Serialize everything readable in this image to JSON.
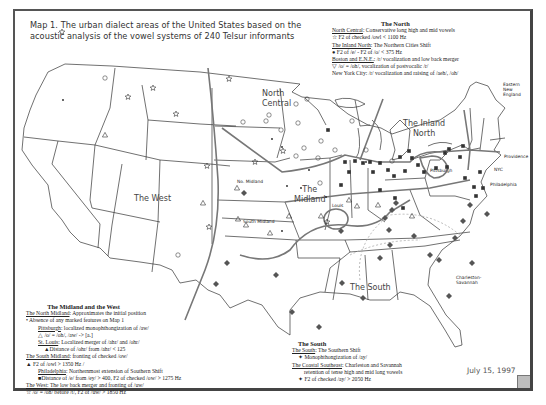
{
  "title": {
    "line1": "Map 1. The urban dialect areas of the United States based on the",
    "line2": "acoustic analysis of  the vowel systems of 240 Telsur informants"
  },
  "date": "July 15, 1997",
  "region_labels": {
    "north_central": [
      "North",
      "Central"
    ],
    "inland_north": [
      "The Inland",
      "North"
    ],
    "west": "The West",
    "midland": [
      "The",
      "Midland"
    ],
    "south": "The South",
    "no_midland": "No. Midland",
    "south_midland": "South Midland",
    "st_louis": "Louis",
    "pittsburgh": "Pittsburgh",
    "eastern_new_england": [
      "Eastern",
      "New",
      "England"
    ],
    "providence": "Providence",
    "nyc": "NYC",
    "philadelphia": "Philadelphia",
    "charleston_savannah": [
      "Charleston-",
      "Savannah"
    ]
  },
  "legend_north": {
    "heading": "The North",
    "lines": [
      {
        "u": "North Central",
        "t": ":  Conservative long high and mid vowels"
      },
      {
        "sym": "☆",
        "t": "  F2 of checked /owl < 1100 Hz"
      },
      {
        "u": "The Inland North",
        "t": ":  The Northern Cities Shift"
      },
      {
        "sym": "●",
        "t": "  F2 of /e/ - F2 of /o/ < 375 Hz"
      },
      {
        "u": "Boston and E.N.E.",
        "t": ":  /r/ vocalization and low back merger"
      },
      {
        "sym": "▽",
        "t": "  /o/ = /oh/, vocalization of postvocalic /r/"
      },
      {
        "u": "",
        "t": "New York City:  /r/ vocalization and raising of /aeh/, /oh/"
      }
    ]
  },
  "legend_midland_west": {
    "heading": "The Midland and the West",
    "lines": [
      {
        "u": "The North Midland",
        "t": ":  Approximates the initial position",
        "indent": 0
      },
      {
        "sym": "•",
        "t": "  Absence of any marked features on Map 1",
        "indent": 0
      },
      {
        "u": "Pittsburgh",
        "t": ":  localized monophthongization of /aw/",
        "indent": 2
      },
      {
        "sym": "△",
        "t": " /o/ = /oh/, /aw/ -> [a.]",
        "indent": 2
      },
      {
        "u": "St. Louis",
        "t": ":  Localized merger of /ahr/ and /ohr/",
        "indent": 2
      },
      {
        "sym": "▲",
        "t": "Distance of /ohr/ from /ahr/ < 125",
        "indent": 3
      },
      {
        "u": "The South Midland",
        "t": ":  fronting of checked /ow/",
        "indent": 0
      },
      {
        "sym": "▲",
        "t": " F2 of /owl > 1350 Hz /",
        "indent": 0
      },
      {
        "u": "Philadelphia",
        "t": ":  Northernmost extension of Southern Shift",
        "indent": 2
      },
      {
        "sym": "■",
        "t": "Distance of /e/ from /ey/ > 400, F2 of checked /ow/ > 1275 Hz",
        "indent": 2
      },
      {
        "u": "The West",
        "t": ":  The low back merger and fronting of /uw/",
        "indent": 0
      },
      {
        "sym": "☆",
        "t": " /o/ = /oh/ before /t/, F2 of /uw/ > 1850 Hz",
        "indent": 0
      }
    ]
  },
  "legend_south": {
    "heading": "The South",
    "lines": [
      {
        "u": "The South",
        "t": ":  The Southern Shift",
        "indent": 0
      },
      {
        "sym": "✦",
        "t": " Monophthongization of /ay/",
        "indent": 1
      },
      {
        "u": "The Coastal Southeast",
        "t": ":  Charleston and Savannah",
        "indent": 0
      },
      {
        "sym": "",
        "t": "retention of tense high and mid long vowels",
        "indent": 2
      },
      {
        "sym": "✦",
        "t": " F2 of checked /ay/ > 2050 Hz",
        "indent": 1
      }
    ]
  },
  "symbols": {
    "stars": [
      [
        62,
        32
      ],
      [
        128,
        97
      ],
      [
        153,
        88
      ],
      [
        176,
        114
      ],
      [
        209,
        227
      ],
      [
        229,
        79
      ],
      [
        283,
        151
      ],
      [
        327,
        222
      ],
      [
        255,
        162
      ],
      [
        207,
        166
      ]
    ],
    "circles": [
      [
        105,
        78
      ],
      [
        243,
        122
      ],
      [
        266,
        121
      ],
      [
        281,
        130
      ],
      [
        298,
        123
      ],
      [
        304,
        148
      ],
      [
        296,
        156
      ],
      [
        321,
        141
      ],
      [
        318,
        158
      ],
      [
        352,
        121
      ],
      [
        335,
        150
      ],
      [
        366,
        150
      ],
      [
        392,
        161
      ],
      [
        320,
        183
      ],
      [
        269,
        115
      ],
      [
        296,
        104
      ],
      [
        307,
        99
      ],
      [
        178,
        255
      ]
    ],
    "dots": [
      [
        63,
        100
      ],
      [
        272,
        139
      ],
      [
        282,
        147
      ],
      [
        287,
        186
      ],
      [
        301,
        188
      ],
      [
        282,
        231
      ],
      [
        326,
        197
      ],
      [
        309,
        170
      ],
      [
        366,
        162
      ]
    ],
    "diamonds": [
      [
        216,
        284
      ],
      [
        276,
        275
      ],
      [
        227,
        263
      ],
      [
        244,
        193
      ],
      [
        292,
        312
      ],
      [
        319,
        327
      ],
      [
        342,
        283
      ],
      [
        341,
        231
      ],
      [
        363,
        298
      ],
      [
        380,
        258
      ],
      [
        390,
        245
      ],
      [
        389,
        230
      ],
      [
        385,
        218
      ],
      [
        396,
        203
      ],
      [
        392,
        210
      ],
      [
        414,
        236
      ],
      [
        430,
        255
      ],
      [
        455,
        238
      ],
      [
        463,
        221
      ],
      [
        449,
        296
      ],
      [
        439,
        260
      ],
      [
        472,
        263
      ],
      [
        487,
        214
      ],
      [
        470,
        205
      ]
    ],
    "triangles": [
      [
        105,
        135
      ],
      [
        203,
        203
      ],
      [
        238,
        219
      ],
      [
        246,
        225
      ],
      [
        270,
        233
      ],
      [
        289,
        216
      ],
      [
        321,
        216
      ],
      [
        349,
        200
      ],
      [
        378,
        205
      ],
      [
        412,
        216
      ],
      [
        237,
        188
      ],
      [
        357,
        206
      ]
    ],
    "squares": [
      [
        355,
        161
      ],
      [
        363,
        163
      ],
      [
        370,
        162
      ],
      [
        380,
        163
      ],
      [
        388,
        170
      ],
      [
        400,
        157
      ],
      [
        412,
        158
      ],
      [
        418,
        165
      ],
      [
        424,
        172
      ],
      [
        373,
        172
      ],
      [
        394,
        176
      ],
      [
        405,
        171
      ],
      [
        436,
        168
      ],
      [
        447,
        167
      ],
      [
        460,
        157
      ],
      [
        465,
        178
      ],
      [
        474,
        187
      ],
      [
        483,
        188
      ],
      [
        476,
        196
      ],
      [
        480,
        172
      ],
      [
        449,
        149
      ],
      [
        463,
        146
      ],
      [
        445,
        153
      ],
      [
        345,
        162
      ],
      [
        349,
        172
      ],
      [
        341,
        185
      ],
      [
        380,
        190
      ],
      [
        395,
        198
      ],
      [
        403,
        208
      ],
      [
        328,
        130
      ],
      [
        409,
        151
      ]
    ]
  }
}
